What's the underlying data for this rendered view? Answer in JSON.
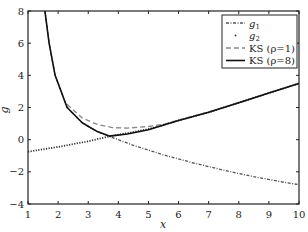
{
  "chart_data": {
    "type": "line",
    "title": "",
    "xlabel": "x",
    "ylabel": "g",
    "xlim": [
      1,
      10
    ],
    "ylim": [
      -4,
      8
    ],
    "xticks": [
      1,
      2,
      3,
      4,
      5,
      6,
      7,
      8,
      9,
      10
    ],
    "yticks": [
      -4,
      -2,
      0,
      2,
      4,
      6,
      8
    ],
    "xtick_labels": [
      "1",
      "2",
      "3",
      "4",
      "5",
      "6",
      "7",
      "8",
      "9",
      "10"
    ],
    "ytick_labels": [
      "−4",
      "−2",
      "0",
      "2",
      "4",
      "6",
      "8"
    ],
    "grid": false,
    "legend_position": "upper right",
    "series": [
      {
        "name": "g1",
        "label_main": "g",
        "label_sub": "1",
        "style": "dashdot",
        "color": "#555555",
        "x": [
          1.56,
          1.7,
          1.9,
          2.3,
          2.8,
          3.3,
          3.7,
          4.5,
          5.5,
          6.5,
          7.5,
          8.5,
          9.5,
          10
        ],
        "y": [
          8.0,
          6.0,
          4.0,
          2.0,
          1.05,
          0.5,
          0.2,
          -0.35,
          -0.95,
          -1.45,
          -1.9,
          -2.3,
          -2.65,
          -2.8
        ]
      },
      {
        "name": "g2",
        "label_main": "g",
        "label_sub": "2",
        "style": "dotted",
        "color": "#333333",
        "x": [
          1,
          2,
          3,
          3.7,
          5,
          6,
          7,
          8,
          9,
          10
        ],
        "y": [
          -0.75,
          -0.45,
          -0.1,
          0.2,
          0.65,
          1.2,
          1.7,
          2.3,
          2.9,
          3.5
        ]
      },
      {
        "name": "KS(rho=1)",
        "label_main": "KS (ρ=1)",
        "style": "dashed",
        "color": "#888888",
        "x": [
          2.3,
          2.8,
          3.3,
          3.8,
          4.3,
          5.0,
          5.5,
          6.0,
          7,
          8,
          9,
          10
        ],
        "y": [
          2.2,
          1.35,
          0.95,
          0.75,
          0.72,
          0.82,
          0.95,
          1.22,
          1.72,
          2.3,
          2.9,
          3.5
        ]
      },
      {
        "name": "KS(rho=8)",
        "label_main": "KS (ρ=8)",
        "style": "solid",
        "color": "#111111",
        "x": [
          1.56,
          1.7,
          1.9,
          2.3,
          2.8,
          3.3,
          3.7,
          4.3,
          5.0,
          6.0,
          7,
          8,
          9,
          10
        ],
        "y": [
          8.0,
          6.0,
          4.0,
          2.0,
          1.05,
          0.5,
          0.22,
          0.35,
          0.62,
          1.2,
          1.7,
          2.3,
          2.9,
          3.5
        ]
      }
    ]
  }
}
